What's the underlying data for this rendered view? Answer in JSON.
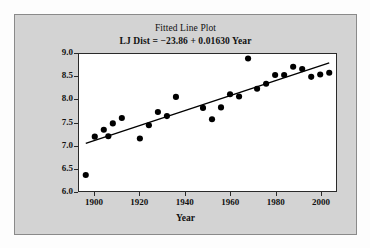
{
  "chart_data": {
    "type": "scatter",
    "title": "Fitted Line Plot",
    "subtitle": "LJ Dist = −23.86 + 0.01630 Year",
    "xlabel": "Year",
    "ylabel": "Long Jump (meters)",
    "xlim": [
      1893,
      2007
    ],
    "ylim": [
      6.0,
      9.0
    ],
    "xticks": [
      1900,
      1920,
      1940,
      1960,
      1980,
      2000
    ],
    "yticks": [
      "6.0",
      "6.5",
      "7.0",
      "7.5",
      "8.0",
      "8.5",
      "9.0"
    ],
    "grid": false,
    "legend": null,
    "regression": {
      "intercept": -23.86,
      "slope": 0.0163,
      "equation": "LJ Dist = −23.86 + 0.01630 Year",
      "x_start": 1896,
      "x_end": 2004
    },
    "x": [
      1896,
      1900,
      1904,
      1906,
      1908,
      1912,
      1920,
      1924,
      1928,
      1932,
      1936,
      1948,
      1952,
      1956,
      1960,
      1964,
      1968,
      1972,
      1976,
      1980,
      1984,
      1988,
      1992,
      1996,
      2000,
      2004
    ],
    "y": [
      6.35,
      7.19,
      7.34,
      7.2,
      7.48,
      7.6,
      7.15,
      7.44,
      7.73,
      7.64,
      8.06,
      7.82,
      7.57,
      7.83,
      8.12,
      8.07,
      8.9,
      8.24,
      8.35,
      8.54,
      8.54,
      8.72,
      8.67,
      8.5,
      8.55,
      8.59
    ],
    "series_name": "Long Jump winning distance",
    "marker": "filled-circle",
    "marker_color": "#000000",
    "line_color": "#000000",
    "plot_background": "#ffffff",
    "panel_background": "#d3d3d3"
  },
  "figure": {
    "title": "Fitted Line Plot",
    "subtitle": "LJ Dist = −23.86 + 0.01630 Year",
    "xlabel": "Year",
    "ylabel": "Long Jump (meters)"
  }
}
